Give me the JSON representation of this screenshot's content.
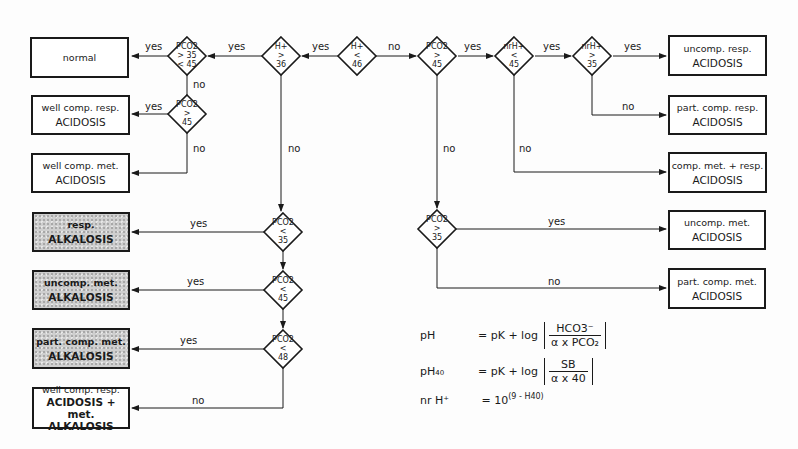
{
  "diagram": {
    "type": "flowchart",
    "topic": "acid-base disorder classification",
    "decisions": [
      {
        "id": "d_pco2_normal",
        "line1": "PCO2",
        "line2": "> 35",
        "line3": "< 45",
        "cx": 187,
        "cy": 56
      },
      {
        "id": "d_h_gt36",
        "line1": "H+",
        "line2": ">",
        "line3": "36",
        "cx": 281,
        "cy": 56
      },
      {
        "id": "d_h_lt46",
        "line1": "H+",
        "line2": "<",
        "line3": "46",
        "cx": 357,
        "cy": 56
      },
      {
        "id": "d_pco2_gt45_top",
        "line1": "PCO2",
        "line2": ">",
        "line3": "45",
        "cx": 437,
        "cy": 56
      },
      {
        "id": "d_nrh_lt45",
        "line1": "nrH+",
        "line2": "<",
        "line3": "45",
        "cx": 514,
        "cy": 56
      },
      {
        "id": "d_nrh_gt35",
        "line1": "nrH+",
        "line2": ">",
        "line3": "35",
        "cx": 592,
        "cy": 56
      },
      {
        "id": "d_pco2_gt45_left",
        "line1": "PCO2",
        "line2": ">",
        "line3": "45",
        "cx": 187,
        "cy": 114
      },
      {
        "id": "d_pco2_lt35",
        "line1": "PCO2",
        "line2": "<",
        "line3": "35",
        "cx": 283,
        "cy": 232
      },
      {
        "id": "d_pco2_lt45",
        "line1": "PCO2",
        "line2": "<",
        "line3": "45",
        "cx": 283,
        "cy": 290
      },
      {
        "id": "d_pco2_lt48",
        "line1": "PCO2",
        "line2": "<",
        "line3": "48",
        "cx": 283,
        "cy": 349
      },
      {
        "id": "d_pco2_gt35_right",
        "line1": "PCO2",
        "line2": ">",
        "line3": "35",
        "cx": 437,
        "cy": 229
      }
    ],
    "outcomes": [
      {
        "id": "o_normal",
        "line1": "normal",
        "line2": "",
        "line3": "",
        "shaded": false
      },
      {
        "id": "o_well_comp_resp_acid",
        "line1": "well comp. resp.",
        "line2": "ACIDOSIS",
        "line3": "",
        "shaded": false
      },
      {
        "id": "o_well_comp_met_acid",
        "line1": "well comp. met.",
        "line2": "ACIDOSIS",
        "line3": "",
        "shaded": false
      },
      {
        "id": "o_resp_alk",
        "line1": "resp.",
        "line2": "ALKALOSIS",
        "line3": "",
        "shaded": true
      },
      {
        "id": "o_uncomp_met_alk",
        "line1": "uncomp. met.",
        "line2": "ALKALOSIS",
        "line3": "",
        "shaded": true
      },
      {
        "id": "o_part_comp_met_alk",
        "line1": "part. comp. met.",
        "line2": "ALKALOSIS",
        "line3": "",
        "shaded": true
      },
      {
        "id": "o_well_comp_resp_acid_met_alk",
        "line1": "well comp. resp.",
        "line2": "ACIDOSIS + met.",
        "line3": "ALKALOSIS",
        "shaded": false
      },
      {
        "id": "o_uncomp_resp_acid",
        "line1": "uncomp. resp.",
        "line2": "ACIDOSIS",
        "line3": "",
        "shaded": false
      },
      {
        "id": "o_part_comp_resp_acid",
        "line1": "part. comp. resp.",
        "line2": "ACIDOSIS",
        "line3": "",
        "shaded": false
      },
      {
        "id": "o_comp_met_resp_acid",
        "line1": "comp. met. + resp.",
        "line2": "ACIDOSIS",
        "line3": "",
        "shaded": false
      },
      {
        "id": "o_uncomp_met_acid",
        "line1": "uncomp. met.",
        "line2": "ACIDOSIS",
        "line3": "",
        "shaded": false
      },
      {
        "id": "o_part_comp_met_acid",
        "line1": "part. comp. met.",
        "line2": "ACIDOSIS",
        "line3": "",
        "shaded": false
      }
    ],
    "edge_labels": {
      "yes": "yes",
      "no": "no"
    },
    "formulas": {
      "f1_lhs": "pH",
      "f1_eq": "= pK + log",
      "f1_num": "HCO3⁻",
      "f1_den": "α x PCO₂",
      "f2_lhs": "pH₄₀",
      "f2_eq": "= pK + log",
      "f2_num": "SB",
      "f2_den": "α x 40",
      "f3_lhs": "nr H⁺",
      "f3_eq": "= 10",
      "f3_exp": "(9 - H40)"
    }
  }
}
